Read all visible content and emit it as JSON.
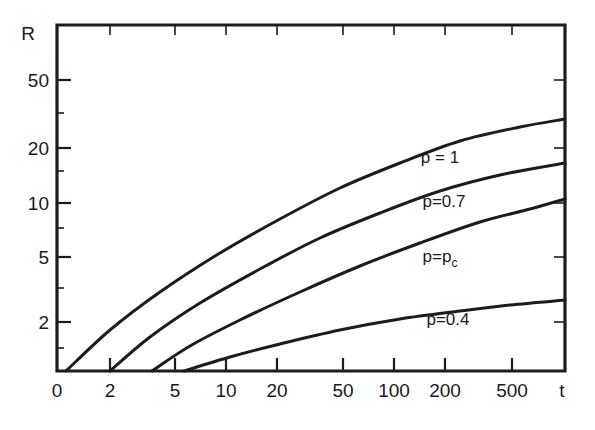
{
  "chart_data": {
    "type": "line",
    "title": "",
    "xlabel": "t",
    "ylabel": "R",
    "xscale": "log",
    "yscale": "log",
    "xtick_labels": [
      "0",
      "2",
      "5",
      "10",
      "20",
      "50",
      "100",
      "200",
      "500"
    ],
    "ytick_labels": [
      "2",
      "5",
      "10",
      "20",
      "50"
    ],
    "grid": false,
    "legend_position": "inline-curve-labels",
    "line_color": "#1c1c1c",
    "background_color": "#ffffff",
    "series": [
      {
        "name": "p = 1",
        "label": "p = 1",
        "label_x_px": 440,
        "label_y_px": 163,
        "points_px": [
          [
            66,
            371
          ],
          [
            110,
            330
          ],
          [
            160,
            292
          ],
          [
            220,
            253
          ],
          [
            280,
            219
          ],
          [
            340,
            188
          ],
          [
            400,
            163
          ],
          [
            460,
            141
          ],
          [
            520,
            127
          ],
          [
            565,
            119
          ]
        ]
      },
      {
        "name": "p=0.7",
        "label": "p=0.7",
        "label_x_px": 444,
        "label_y_px": 207,
        "points_px": [
          [
            110,
            371
          ],
          [
            150,
            337
          ],
          [
            200,
            303
          ],
          [
            260,
            269
          ],
          [
            320,
            238
          ],
          [
            380,
            213
          ],
          [
            440,
            191
          ],
          [
            500,
            175
          ],
          [
            565,
            163
          ]
        ]
      },
      {
        "name": "p=p_c",
        "label": "p=p",
        "label_sub": "c",
        "label_x_px": 440,
        "label_y_px": 262,
        "points_px": [
          [
            152,
            371
          ],
          [
            190,
            346
          ],
          [
            240,
            320
          ],
          [
            300,
            292
          ],
          [
            360,
            266
          ],
          [
            420,
            243
          ],
          [
            480,
            222
          ],
          [
            530,
            209
          ],
          [
            565,
            199
          ]
        ]
      },
      {
        "name": "p=0.4",
        "label": "p=0.4",
        "label_x_px": 448,
        "label_y_px": 325,
        "points_px": [
          [
            184,
            371
          ],
          [
            230,
            357
          ],
          [
            280,
            344
          ],
          [
            340,
            330
          ],
          [
            400,
            319
          ],
          [
            460,
            311
          ],
          [
            510,
            305
          ],
          [
            565,
            300
          ]
        ]
      }
    ]
  },
  "axes": {
    "y_label": "R",
    "x_label": "t",
    "x_origin_label": "0",
    "y_ticks": [
      {
        "label": "50",
        "y_px": 80
      },
      {
        "label": "20",
        "y_px": 148
      },
      {
        "label": "10",
        "y_px": 203
      },
      {
        "label": "5",
        "y_px": 257
      },
      {
        "label": "2",
        "y_px": 322
      }
    ],
    "x_ticks": [
      {
        "label": "2",
        "x_px": 110
      },
      {
        "label": "5",
        "x_px": 175
      },
      {
        "label": "10",
        "x_px": 226
      },
      {
        "label": "20",
        "x_px": 277
      },
      {
        "label": "50",
        "x_px": 343
      },
      {
        "label": "100",
        "x_px": 394
      },
      {
        "label": "200",
        "x_px": 445
      },
      {
        "label": "500",
        "x_px": 512
      }
    ]
  }
}
